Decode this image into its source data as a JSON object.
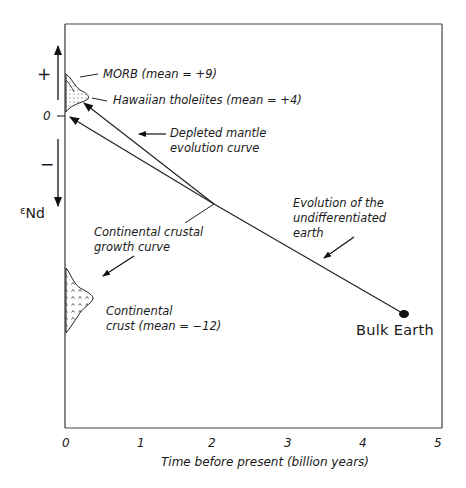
{
  "diagram": {
    "title": "",
    "y_axis": {
      "label_symbol": "ε",
      "label_subscript": "Nd",
      "plus": "+",
      "zero": "0",
      "minus": "−"
    },
    "x_axis": {
      "label": "Time before present (billion years)",
      "ticks": [
        "0",
        "1",
        "2",
        "3",
        "4",
        "5"
      ]
    },
    "annotations": {
      "morb": "MORB  (mean = +9)",
      "hawaiian": "Hawaiian tholeiites (mean = +4)",
      "depleted_line1": "Depleted mantle",
      "depleted_line2": "evolution curve",
      "continental_growth_line1": "Continental crustal",
      "continental_growth_line2": "growth curve",
      "continental_crust_line1": "Continental",
      "continental_crust_line2": "crust (mean = −12)",
      "undiff_line1": "Evolution of the",
      "undiff_line2": "undifferentiated",
      "undiff_line3": "earth",
      "bulk_earth": "Bulk Earth"
    }
  }
}
